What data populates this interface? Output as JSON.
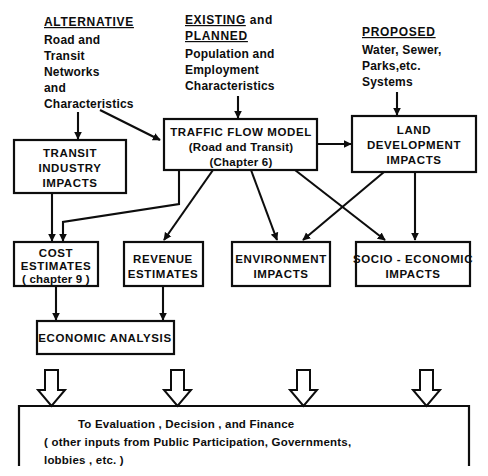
{
  "diagram": {
    "line_color": "#0d0d0d",
    "background_color": "#ffffff",
    "headers": [
      {
        "id": "alternative",
        "title": "ALTERNATIVE",
        "lines": [
          "Road and",
          "Transit",
          "Networks",
          "and",
          "Characteristics"
        ]
      },
      {
        "id": "existing-planned",
        "title": "EXISTING",
        "title_suffix": " and",
        "title2": "PLANNED",
        "lines": [
          "Population and",
          "Employment",
          "Characteristics"
        ]
      },
      {
        "id": "proposed",
        "title": "PROPOSED",
        "lines": [
          "Water, Sewer,",
          "Parks,etc.",
          "Systems"
        ]
      }
    ],
    "boxes": [
      {
        "id": "traffic-flow-model",
        "lines": [
          "TRAFFIC FLOW MODEL",
          "(Road and Transit)",
          "(Chapter 6)"
        ]
      },
      {
        "id": "land-development-impacts",
        "lines": [
          "LAND",
          "DEVELOPMENT",
          "IMPACTS"
        ]
      },
      {
        "id": "transit-industry-impacts",
        "lines": [
          "TRANSIT",
          "INDUSTRY",
          "IMPACTS"
        ]
      },
      {
        "id": "cost-estimates",
        "lines": [
          "COST",
          "ESTIMATES",
          "( chapter 9 )"
        ]
      },
      {
        "id": "revenue-estimates",
        "lines": [
          "REVENUE",
          "ESTIMATES"
        ]
      },
      {
        "id": "environment-impacts",
        "lines": [
          "ENVIRONMENT",
          "IMPACTS"
        ]
      },
      {
        "id": "socio-economic-impacts",
        "lines": [
          "SOCIO - ECONOMIC",
          "IMPACTS"
        ]
      },
      {
        "id": "economic-analysis",
        "lines": [
          "ECONOMIC  ANALYSIS"
        ]
      }
    ],
    "footer": {
      "id": "evaluation-decision-finance",
      "lines": [
        "To Evaluation , Decision , and  Finance",
        "( other inputs from  Public Participation, Governments,",
        " lobbies , etc. )"
      ]
    },
    "hollow_arrow_count": 4
  }
}
